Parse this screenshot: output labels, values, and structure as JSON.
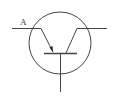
{
  "diagram": {
    "type": "transistor-symbol",
    "label": "A",
    "stroke_color": "#444444",
    "background": "#ffffff"
  }
}
